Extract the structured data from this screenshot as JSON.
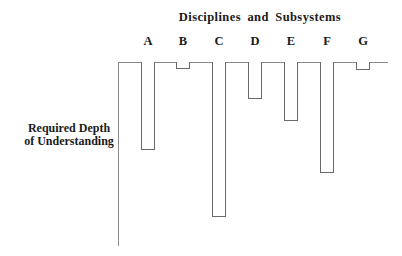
{
  "chart_data": {
    "type": "bar",
    "orientation": "vertical-downward",
    "title": "Disciplines and Subsystems",
    "xlabel": "Disciplines and Subsystems",
    "ylabel": "Required Depth of Understanding",
    "ylabel_lines": [
      "Required Depth",
      "of Understanding"
    ],
    "categories": [
      "A",
      "B",
      "C",
      "D",
      "E",
      "F",
      "G"
    ],
    "values": [
      88,
      7,
      155,
      37,
      59,
      111,
      8
    ],
    "units": "relative depth (arbitrary, axis length = 184)",
    "ylim": [
      0,
      184
    ],
    "grid": false,
    "legend": null,
    "tick_labels_y": []
  },
  "layout": {
    "axis_origin_x": 118,
    "axis_origin_y": 62,
    "bar_width": 14,
    "bar_x": [
      141,
      176,
      212,
      248,
      284,
      320,
      356
    ]
  }
}
